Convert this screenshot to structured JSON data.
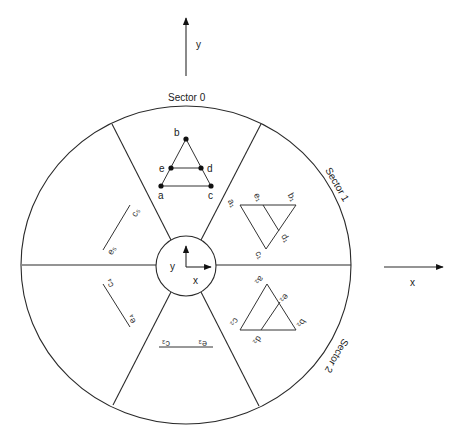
{
  "diagram": {
    "axes": {
      "global_y_label": "y",
      "global_x_label": "x",
      "local_y_label": "y",
      "local_x_label": "x"
    },
    "sectors": [
      {
        "label": "Sector 0"
      },
      {
        "label": "Sector 1"
      },
      {
        "label": "Sector 2"
      }
    ],
    "sector0_points": {
      "a": "a",
      "b": "b",
      "c": "c",
      "d": "d",
      "e": "e"
    },
    "sector1_labels": {
      "a": "a₁",
      "b": "b₁",
      "c": "c₁",
      "d": "d₁",
      "e": "e₁"
    },
    "sector2_labels": {
      "a": "a₂",
      "b": "b₂",
      "c": "c₂",
      "d": "d₂",
      "e": "e₂"
    },
    "sector3_labels": {
      "c": "c₃",
      "e": "e₃"
    },
    "sector4_labels": {
      "c": "c₄",
      "e": "e₄"
    },
    "sector5_labels": {
      "c": "c₅",
      "e": "e₅"
    },
    "colors": {
      "line": "#2a2a2a",
      "background": "#ffffff"
    }
  }
}
